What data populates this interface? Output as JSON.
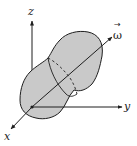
{
  "diagram": {
    "labels": {
      "z": "z",
      "y": "y",
      "x": "x",
      "omega": "ω",
      "omega_arrow": "→"
    },
    "colors": {
      "body_fill": "#c9c9c9",
      "stroke": "#1e1e1e",
      "background": "#ffffff"
    }
  }
}
